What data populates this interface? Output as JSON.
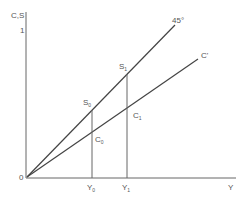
{
  "diagram": {
    "axes": {
      "y_label": "C,S",
      "y_tick": "1",
      "x_label": "Y",
      "origin_label": "0"
    },
    "lines": [
      {
        "name": "45-degree line",
        "label": "45°"
      },
      {
        "name": "consumption function",
        "label": "C'"
      }
    ],
    "points": {
      "S0": {
        "base": "S",
        "sub": "0"
      },
      "S1": {
        "base": "S",
        "sub": "1"
      },
      "C0": {
        "base": "C",
        "sub": "0"
      },
      "C1": {
        "base": "C",
        "sub": "1"
      }
    },
    "x_ticks": {
      "Y0": {
        "base": "Y",
        "sub": "0"
      },
      "Y1": {
        "base": "Y",
        "sub": "1"
      }
    },
    "colors": {
      "line": "#444444",
      "text": "#555555"
    }
  }
}
